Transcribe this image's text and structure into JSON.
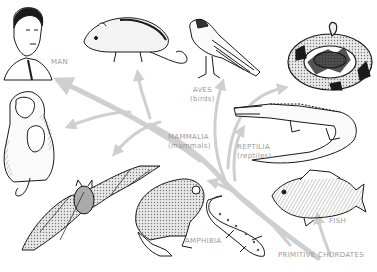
{
  "diagram": {
    "type": "evolutionary-tree",
    "root": "PRIMITIVE CHORDATES",
    "colors": {
      "arrow": "#cfcfcf",
      "label": "#9a9a9a",
      "ink": "#1a1a1a",
      "background": "#ffffff"
    },
    "labels": {
      "man": "MAN",
      "aves": "AVES",
      "aves_common": "(birds)",
      "mammalia": "MAMMALIA",
      "mammalia_common": "(mammals)",
      "reptilia": "REPTILIA",
      "reptilia_common": "(reptiles)",
      "fish": "FISH",
      "amphibia": "AMPHIBIA",
      "primitive_chordates": "PRIMITIVE CHORDATES"
    },
    "illustrations": [
      {
        "name": "man",
        "group": "Mammalia"
      },
      {
        "name": "rat",
        "group": "Mammalia"
      },
      {
        "name": "monkey",
        "group": "Mammalia"
      },
      {
        "name": "bat",
        "group": "Mammalia"
      },
      {
        "name": "bird",
        "group": "Aves"
      },
      {
        "name": "snake",
        "group": "Reptilia"
      },
      {
        "name": "crocodile",
        "group": "Reptilia"
      },
      {
        "name": "fish",
        "group": "Fish"
      },
      {
        "name": "frog",
        "group": "Amphibia"
      },
      {
        "name": "salamander",
        "group": "Amphibia"
      }
    ]
  }
}
